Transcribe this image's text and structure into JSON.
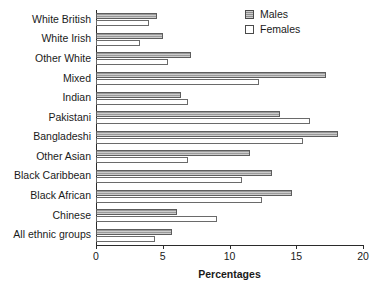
{
  "chart_data": {
    "type": "bar",
    "orientation": "horizontal",
    "title": "",
    "xlabel": "Percentages",
    "ylabel": "",
    "xlim": [
      0,
      20
    ],
    "xticks": [
      0,
      5,
      10,
      15,
      20
    ],
    "grid": false,
    "legend_position": "top-right",
    "categories": [
      "White British",
      "White Irish",
      "Other White",
      "Mixed",
      "Indian",
      "Pakistani",
      "Bangladeshi",
      "Other Asian",
      "Black Caribbean",
      "Black African",
      "Chinese",
      "All ethnic groups"
    ],
    "series": [
      {
        "name": "Males",
        "color": "#9a9a9a",
        "values": [
          4.6,
          5.0,
          7.1,
          17.2,
          6.4,
          13.8,
          18.1,
          11.5,
          13.2,
          14.7,
          6.1,
          5.7
        ]
      },
      {
        "name": "Females",
        "color": "#ffffff",
        "values": [
          4.0,
          3.3,
          5.4,
          12.2,
          6.9,
          16.0,
          15.5,
          6.9,
          10.9,
          12.4,
          9.1,
          4.4
        ]
      }
    ]
  },
  "legend": {
    "items": [
      {
        "label": "Males",
        "swatch": "males"
      },
      {
        "label": "Females",
        "swatch": "females"
      }
    ]
  },
  "axis": {
    "x_label": "Percentages",
    "tick_labels": [
      "0",
      "5",
      "10",
      "15",
      "20"
    ]
  }
}
